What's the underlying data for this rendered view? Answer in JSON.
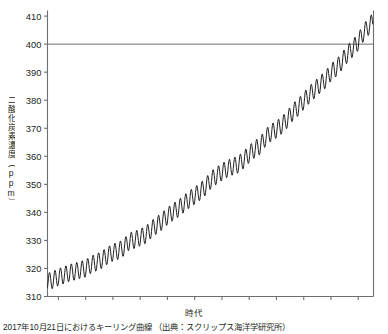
{
  "figure": {
    "caption": "2017年10月21日におけるキーリング曲線 （出典：スクリップス海洋学研究所）"
  },
  "chart_data": {
    "type": "line",
    "title": "",
    "subtitle": "",
    "xlabel": "時代",
    "ylabel": "二酸化炭素濃度（ppm）",
    "xlim": [
      1958,
      2017.8
    ],
    "ylim": [
      310,
      412
    ],
    "grid": false,
    "legend": null,
    "x_ticks": [
      1960,
      1965,
      1970,
      1975,
      1980,
      1985,
      1990,
      1995,
      2000,
      2005,
      2010,
      2015
    ],
    "y_ticks": [
      310,
      320,
      330,
      340,
      350,
      360,
      370,
      380,
      390,
      400,
      410
    ],
    "annotations": [
      {
        "type": "hline",
        "value": 400,
        "label": "400 ppm reference line",
        "color": "#6d6e71"
      }
    ],
    "series": [
      {
        "name": "Atmospheric CO2 concentration (Mauna Loa)",
        "color": "#231f20",
        "seasonal_amplitude_ppm": 3.1,
        "x": [
          1958,
          1959,
          1960,
          1961,
          1962,
          1963,
          1964,
          1965,
          1966,
          1967,
          1968,
          1969,
          1970,
          1971,
          1972,
          1973,
          1974,
          1975,
          1976,
          1977,
          1978,
          1979,
          1980,
          1981,
          1982,
          1983,
          1984,
          1985,
          1986,
          1987,
          1988,
          1989,
          1990,
          1991,
          1992,
          1993,
          1994,
          1995,
          1996,
          1997,
          1998,
          1999,
          2000,
          2001,
          2002,
          2003,
          2004,
          2005,
          2006,
          2007,
          2008,
          2009,
          2010,
          2011,
          2012,
          2013,
          2014,
          2015,
          2016,
          2017
        ],
        "annual_mean": [
          315.3,
          315.9,
          316.9,
          317.6,
          318.4,
          318.9,
          319.5,
          320.0,
          321.4,
          322.2,
          323.1,
          324.6,
          325.7,
          326.3,
          327.5,
          329.7,
          330.2,
          331.1,
          332.0,
          333.8,
          335.4,
          336.8,
          338.7,
          340.1,
          341.4,
          343.0,
          344.6,
          346.0,
          347.4,
          349.2,
          351.6,
          353.1,
          354.4,
          355.6,
          356.4,
          357.1,
          358.8,
          360.8,
          362.6,
          363.7,
          366.7,
          368.4,
          369.6,
          371.1,
          373.2,
          375.8,
          377.5,
          379.8,
          381.9,
          383.8,
          385.6,
          387.4,
          389.9,
          391.6,
          393.8,
          396.5,
          398.6,
          400.8,
          404.2,
          406.5
        ]
      }
    ]
  }
}
